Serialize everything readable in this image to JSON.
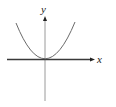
{
  "figure": {
    "type": "coordinate-graph",
    "curve": "parabola opening upward with vertex at origin",
    "axes": {
      "x_label": "x",
      "y_label": "y"
    },
    "colors": {
      "axis": "#3a3a3a",
      "y_axis": "#9a9a9a",
      "curve": "#6a6a6a"
    }
  }
}
